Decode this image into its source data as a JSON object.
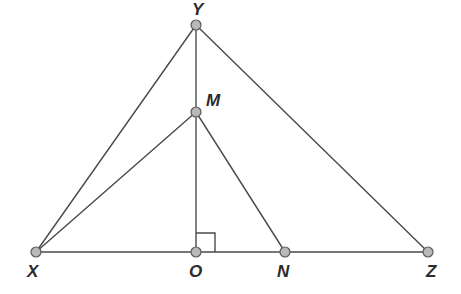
{
  "figure": {
    "kind": "euclidean-geometry-diagram",
    "width": 461,
    "height": 294,
    "background_color": "#ffffff",
    "stroke_color": "#4a4a4a",
    "stroke_width": 1.4,
    "node_fill_color": "#b8b8b8",
    "node_stroke_color": "#5a5a5a",
    "node_radius": 5,
    "label_color": "#2b2b2b"
  },
  "labels": {
    "apex": "Y",
    "midpoint": "M",
    "base_left": "X",
    "base_foot": "O",
    "base_mid_right": "N",
    "base_right": "Z"
  },
  "points": [
    {
      "id": "Y",
      "name": "apex-vertex",
      "x": 196,
      "y": 25,
      "label": "Y",
      "label_x": 192,
      "label_y": 1,
      "label_class": "lbl-apex"
    },
    {
      "id": "M",
      "name": "point-m",
      "x": 196,
      "y": 112,
      "label": "M",
      "label_x": 206,
      "label_y": 92,
      "label_class": "lbl-m"
    },
    {
      "id": "X",
      "name": "base-left-vertex",
      "x": 36,
      "y": 252,
      "label": "X",
      "label_x": 27,
      "label_y": 263,
      "label_class": "lbl-base"
    },
    {
      "id": "O",
      "name": "foot-of-altitude",
      "x": 196,
      "y": 252,
      "label": "O",
      "label_x": 189,
      "label_y": 263,
      "label_class": "lbl-base"
    },
    {
      "id": "N",
      "name": "point-n",
      "x": 285,
      "y": 252,
      "label": "N",
      "label_x": 277,
      "label_y": 263,
      "label_class": "lbl-base"
    },
    {
      "id": "Z",
      "name": "base-right-vertex",
      "x": 428,
      "y": 252,
      "label": "Z",
      "label_x": 426,
      "label_y": 263,
      "label_class": "lbl-base"
    }
  ],
  "segments": [
    {
      "name": "segment-xz-baseline",
      "from": "X",
      "to": "Z",
      "x1": 36,
      "y1": 252,
      "x2": 428,
      "y2": 252
    },
    {
      "name": "segment-xy",
      "from": "X",
      "to": "Y",
      "x1": 36,
      "y1": 252,
      "x2": 196,
      "y2": 25
    },
    {
      "name": "segment-yz",
      "from": "Y",
      "to": "Z",
      "x1": 196,
      "y1": 25,
      "x2": 428,
      "y2": 252
    },
    {
      "name": "segment-yo-altitude",
      "from": "Y",
      "to": "O",
      "x1": 196,
      "y1": 25,
      "x2": 196,
      "y2": 252
    },
    {
      "name": "segment-xm",
      "from": "X",
      "to": "M",
      "x1": 36,
      "y1": 252,
      "x2": 196,
      "y2": 112
    },
    {
      "name": "segment-mn",
      "from": "M",
      "to": "N",
      "x1": 196,
      "y1": 112,
      "x2": 285,
      "y2": 252
    }
  ],
  "right_angle_marker": {
    "name": "right-angle-marker-at-o",
    "at_point": "O",
    "size": 19,
    "path": "M 196 233 L 215 233 L 215 252"
  }
}
